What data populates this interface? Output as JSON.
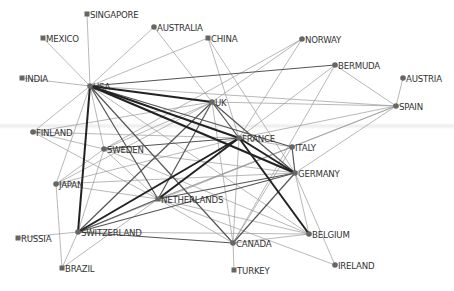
{
  "diagram": {
    "type": "network",
    "node_color": "#666666",
    "label_color": "#333333",
    "edge_colors": {
      "weak": "#9a9a9a",
      "medium": "#555555",
      "strong": "#222222"
    },
    "nodes": [
      {
        "id": "SINGAPORE",
        "label": "SINGAPORE",
        "x": 87,
        "y": 14,
        "shape": "square"
      },
      {
        "id": "MEXICO",
        "label": "MEXICO",
        "x": 43,
        "y": 38,
        "shape": "square"
      },
      {
        "id": "INDIA",
        "label": "INDIA",
        "x": 22,
        "y": 78,
        "shape": "square"
      },
      {
        "id": "AUSTRALIA",
        "label": "AUSTRALIA",
        "x": 154,
        "y": 27,
        "shape": "circle"
      },
      {
        "id": "CHINA",
        "label": "CHINA",
        "x": 208,
        "y": 38,
        "shape": "square"
      },
      {
        "id": "NORWAY",
        "label": "NORWAY",
        "x": 302,
        "y": 39,
        "shape": "circle"
      },
      {
        "id": "BERMUDA",
        "label": "BERMUDA",
        "x": 335,
        "y": 65,
        "shape": "circle"
      },
      {
        "id": "AUSTRIA",
        "label": "AUSTRIA",
        "x": 403,
        "y": 78,
        "shape": "circle"
      },
      {
        "id": "SPAIN",
        "label": "SPAIN",
        "x": 396,
        "y": 106,
        "shape": "circle"
      },
      {
        "id": "USA",
        "label": "USA",
        "x": 90,
        "y": 86,
        "shape": "circle"
      },
      {
        "id": "UK",
        "label": "UK",
        "x": 212,
        "y": 102,
        "shape": "circle"
      },
      {
        "id": "FINLAND",
        "label": "FINLAND",
        "x": 33,
        "y": 132,
        "shape": "circle"
      },
      {
        "id": "SWEDEN",
        "label": "SWEDEN",
        "x": 104,
        "y": 149,
        "shape": "circle"
      },
      {
        "id": "FRANCE",
        "label": "FRANCE",
        "x": 239,
        "y": 138,
        "shape": "circle"
      },
      {
        "id": "ITALY",
        "label": "ITALY",
        "x": 292,
        "y": 147,
        "shape": "circle"
      },
      {
        "id": "GERMANY",
        "label": "GERMANY",
        "x": 295,
        "y": 173,
        "shape": "circle"
      },
      {
        "id": "JAPAN",
        "label": "JAPAN",
        "x": 56,
        "y": 184,
        "shape": "circle"
      },
      {
        "id": "NETHERLANDS",
        "label": "NETHERLANDS",
        "x": 158,
        "y": 199,
        "shape": "square"
      },
      {
        "id": "SWITZERLAND",
        "label": "SWITZERLAND",
        "x": 78,
        "y": 232,
        "shape": "circle"
      },
      {
        "id": "RUSSIA",
        "label": "RUSSIA",
        "x": 18,
        "y": 238,
        "shape": "square"
      },
      {
        "id": "BRAZIL",
        "label": "BRAZIL",
        "x": 62,
        "y": 268,
        "shape": "square"
      },
      {
        "id": "CANADA",
        "label": "CANADA",
        "x": 233,
        "y": 243,
        "shape": "circle"
      },
      {
        "id": "TURKEY",
        "label": "TURKEY",
        "x": 234,
        "y": 270,
        "shape": "square"
      },
      {
        "id": "BELGIUM",
        "label": "BELGIUM",
        "x": 309,
        "y": 234,
        "shape": "circle"
      },
      {
        "id": "IRELAND",
        "label": "IRELAND",
        "x": 335,
        "y": 265,
        "shape": "circle"
      }
    ],
    "edges": [
      [
        "USA",
        "SINGAPORE",
        1
      ],
      [
        "USA",
        "MEXICO",
        1
      ],
      [
        "USA",
        "INDIA",
        1
      ],
      [
        "USA",
        "AUSTRALIA",
        1
      ],
      [
        "USA",
        "CHINA",
        1
      ],
      [
        "USA",
        "BERMUDA",
        2
      ],
      [
        "USA",
        "UK",
        3
      ],
      [
        "USA",
        "FRANCE",
        3
      ],
      [
        "USA",
        "GERMANY",
        3
      ],
      [
        "USA",
        "ITALY",
        2
      ],
      [
        "USA",
        "FINLAND",
        1
      ],
      [
        "USA",
        "JAPAN",
        1
      ],
      [
        "USA",
        "SWITZERLAND",
        3
      ],
      [
        "USA",
        "NETHERLANDS",
        2
      ],
      [
        "USA",
        "SWEDEN",
        1
      ],
      [
        "USA",
        "CANADA",
        2
      ],
      [
        "USA",
        "BELGIUM",
        1
      ],
      [
        "UK",
        "AUSTRALIA",
        1
      ],
      [
        "UK",
        "FRANCE",
        2
      ],
      [
        "UK",
        "GERMANY",
        2
      ],
      [
        "UK",
        "NETHERLANDS",
        2
      ],
      [
        "UK",
        "SWITZERLAND",
        2
      ],
      [
        "UK",
        "FINLAND",
        1
      ],
      [
        "UK",
        "JAPAN",
        1
      ],
      [
        "UK",
        "SWEDEN",
        1
      ],
      [
        "UK",
        "SPAIN",
        1
      ],
      [
        "UK",
        "CANADA",
        1
      ],
      [
        "UK",
        "NORWAY",
        1
      ],
      [
        "CHINA",
        "FRANCE",
        1
      ],
      [
        "CHINA",
        "GERMANY",
        1
      ],
      [
        "NORWAY",
        "FRANCE",
        1
      ],
      [
        "NORWAY",
        "SWEDEN",
        1
      ],
      [
        "BERMUDA",
        "SPAIN",
        1
      ],
      [
        "BERMUDA",
        "CANADA",
        1
      ],
      [
        "BERMUDA",
        "FRANCE",
        1
      ],
      [
        "AUSTRIA",
        "SPAIN",
        1
      ],
      [
        "SPAIN",
        "FRANCE",
        1
      ],
      [
        "SPAIN",
        "GERMANY",
        1
      ],
      [
        "SPAIN",
        "NETHERLANDS",
        1
      ],
      [
        "SPAIN",
        "ITALY",
        1
      ],
      [
        "SPAIN",
        "USA",
        1
      ],
      [
        "FRANCE",
        "GERMANY",
        3
      ],
      [
        "FRANCE",
        "ITALY",
        1
      ],
      [
        "FRANCE",
        "BELGIUM",
        3
      ],
      [
        "FRANCE",
        "NETHERLANDS",
        3
      ],
      [
        "FRANCE",
        "SWITZERLAND",
        3
      ],
      [
        "FRANCE",
        "SWEDEN",
        2
      ],
      [
        "FRANCE",
        "JAPAN",
        1
      ],
      [
        "FRANCE",
        "CANADA",
        1
      ],
      [
        "FRANCE",
        "FINLAND",
        1
      ],
      [
        "ITALY",
        "GERMANY",
        2
      ],
      [
        "ITALY",
        "SWITZERLAND",
        1
      ],
      [
        "ITALY",
        "NETHERLANDS",
        1
      ],
      [
        "ITALY",
        "CANADA",
        1
      ],
      [
        "GERMANY",
        "NETHERLANDS",
        2
      ],
      [
        "GERMANY",
        "SWITZERLAND",
        2
      ],
      [
        "GERMANY",
        "CANADA",
        2
      ],
      [
        "GERMANY",
        "BELGIUM",
        1
      ],
      [
        "GERMANY",
        "IRELAND",
        1
      ],
      [
        "GERMANY",
        "SWEDEN",
        1
      ],
      [
        "GERMANY",
        "JAPAN",
        1
      ],
      [
        "NETHERLANDS",
        "SWITZERLAND",
        2
      ],
      [
        "NETHERLANDS",
        "BELGIUM",
        1
      ],
      [
        "NETHERLANDS",
        "IRELAND",
        1
      ],
      [
        "NETHERLANDS",
        "JAPAN",
        1
      ],
      [
        "NETHERLANDS",
        "SWEDEN",
        1
      ],
      [
        "NETHERLANDS",
        "CANADA",
        1
      ],
      [
        "NETHERLANDS",
        "BRAZIL",
        1
      ],
      [
        "SWITZERLAND",
        "RUSSIA",
        1
      ],
      [
        "SWITZERLAND",
        "BRAZIL",
        1
      ],
      [
        "SWITZERLAND",
        "CANADA",
        2
      ],
      [
        "SWITZERLAND",
        "SWEDEN",
        1
      ],
      [
        "SWITZERLAND",
        "BELGIUM",
        1
      ],
      [
        "FINLAND",
        "SWEDEN",
        1
      ],
      [
        "FINLAND",
        "NETHERLANDS",
        1
      ],
      [
        "JAPAN",
        "BRAZIL",
        1
      ],
      [
        "JAPAN",
        "SWEDEN",
        1
      ],
      [
        "CANADA",
        "TURKEY",
        1
      ],
      [
        "CANADA",
        "BELGIUM",
        1
      ],
      [
        "SWEDEN",
        "BELGIUM",
        1
      ]
    ]
  }
}
